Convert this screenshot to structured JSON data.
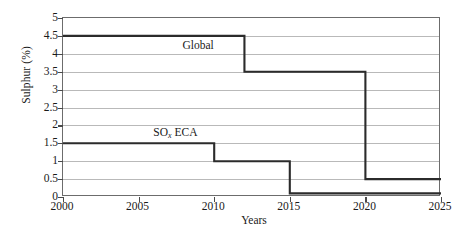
{
  "chart_data": {
    "type": "line",
    "title": "",
    "xlabel": "Years",
    "ylabel": "Sulphur (%)",
    "xlim": [
      2000,
      2025
    ],
    "ylim": [
      0,
      5
    ],
    "xticks": [
      2000,
      2005,
      2010,
      2015,
      2020,
      2025
    ],
    "xticklabels": [
      "2000",
      "2005",
      "2010",
      "2015",
      "2020",
      "2025"
    ],
    "yticks": [
      0,
      0.5,
      1,
      1.5,
      2,
      2.5,
      3,
      3.5,
      4,
      4.5,
      5
    ],
    "yticklabels": [
      "0",
      "0.5",
      "1",
      "1.5",
      "2",
      "2.5",
      "3",
      "3.5",
      "4",
      "4.5",
      "5"
    ],
    "grid": "horizontal",
    "legend_position": "inline-annotation",
    "line_color": "#2b2b2b",
    "grid_color": "#b9b9b9",
    "axis_color": "#6c6c6c",
    "series": [
      {
        "name": "Global",
        "drawstyle": "steps-post",
        "annotation": "Global",
        "annotation_x": 2009,
        "annotation_y": 4.22,
        "x": [
          2000,
          2012,
          2012,
          2020,
          2020,
          2025
        ],
        "y": [
          4.5,
          4.5,
          3.5,
          3.5,
          0.5,
          0.5
        ],
        "steps": [
          {
            "from_year": 2000,
            "to_year": 2012,
            "value": 4.5
          },
          {
            "from_year": 2012,
            "to_year": 2020,
            "value": 3.5
          },
          {
            "from_year": 2020,
            "to_year": 2025,
            "value": 0.5
          }
        ]
      },
      {
        "name": "SOx ECA",
        "drawstyle": "steps-post",
        "annotation": "SO",
        "annotation_sub": "x",
        "annotation_tail": " ECA",
        "annotation_x": 2007.5,
        "annotation_y": 1.78,
        "x": [
          2000,
          2010,
          2010,
          2015,
          2015,
          2025
        ],
        "y": [
          1.5,
          1.5,
          1.0,
          1.0,
          0.1,
          0.1
        ],
        "steps": [
          {
            "from_year": 2000,
            "to_year": 2010,
            "value": 1.5
          },
          {
            "from_year": 2010,
            "to_year": 2015,
            "value": 1.0
          },
          {
            "from_year": 2015,
            "to_year": 2025,
            "value": 0.1
          }
        ]
      }
    ]
  },
  "labels": {
    "ylabel": "Sulphur (%)",
    "xlabel": "Years",
    "global_label": "Global",
    "eca_label_main": "SO",
    "eca_label_sub": "x",
    "eca_label_tail": " ECA"
  }
}
